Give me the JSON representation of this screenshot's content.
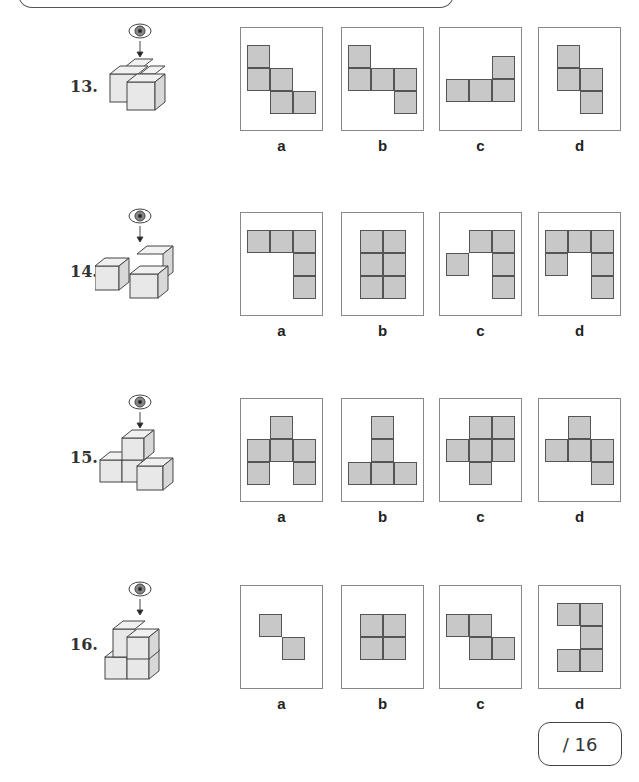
{
  "questions": [
    {
      "number": "13.",
      "view": "top-view-eye",
      "options": [
        {
          "label": "a",
          "cells": [
            [
              0,
              0
            ],
            [
              0,
              1
            ],
            [
              1,
              1
            ],
            [
              1,
              2
            ],
            [
              2,
              2
            ]
          ]
        },
        {
          "label": "b",
          "cells": [
            [
              0,
              0
            ],
            [
              0,
              1
            ],
            [
              1,
              1
            ],
            [
              2,
              1
            ],
            [
              2,
              2
            ]
          ]
        },
        {
          "label": "c",
          "cells": [
            [
              2,
              0
            ],
            [
              0,
              1
            ],
            [
              1,
              1
            ],
            [
              2,
              1
            ]
          ]
        },
        {
          "label": "d",
          "cells": [
            [
              0,
              0
            ],
            [
              0,
              1
            ],
            [
              1,
              1
            ],
            [
              1,
              2
            ]
          ]
        }
      ]
    },
    {
      "number": "14.",
      "view": "top-view-eye",
      "options": [
        {
          "label": "a",
          "cells": [
            [
              0,
              0
            ],
            [
              1,
              0
            ],
            [
              2,
              0
            ],
            [
              2,
              1
            ],
            [
              2,
              2
            ]
          ]
        },
        {
          "label": "b",
          "cells": [
            [
              0,
              0
            ],
            [
              1,
              0
            ],
            [
              0,
              1
            ],
            [
              1,
              1
            ],
            [
              0,
              2
            ],
            [
              1,
              2
            ]
          ]
        },
        {
          "label": "c",
          "cells": [
            [
              1,
              0
            ],
            [
              2,
              0
            ],
            [
              0,
              1
            ],
            [
              2,
              1
            ],
            [
              2,
              2
            ]
          ]
        },
        {
          "label": "d",
          "cells": [
            [
              0,
              0
            ],
            [
              1,
              0
            ],
            [
              2,
              0
            ],
            [
              0,
              1
            ],
            [
              2,
              1
            ],
            [
              2,
              2
            ]
          ]
        }
      ]
    },
    {
      "number": "15.",
      "view": "top-view-eye",
      "options": [
        {
          "label": "a",
          "cells": [
            [
              1,
              0
            ],
            [
              0,
              1
            ],
            [
              1,
              1
            ],
            [
              2,
              1
            ],
            [
              0,
              2
            ],
            [
              2,
              2
            ]
          ]
        },
        {
          "label": "b",
          "cells": [
            [
              1,
              0
            ],
            [
              1,
              1
            ],
            [
              0,
              2
            ],
            [
              1,
              2
            ],
            [
              2,
              2
            ]
          ]
        },
        {
          "label": "c",
          "cells": [
            [
              1,
              0
            ],
            [
              2,
              0
            ],
            [
              0,
              1
            ],
            [
              1,
              1
            ],
            [
              2,
              1
            ],
            [
              1,
              2
            ]
          ]
        },
        {
          "label": "d",
          "cells": [
            [
              1,
              0
            ],
            [
              0,
              1
            ],
            [
              1,
              1
            ],
            [
              2,
              1
            ],
            [
              2,
              2
            ]
          ]
        }
      ]
    },
    {
      "number": "16.",
      "view": "top-view-eye",
      "options": [
        {
          "label": "a",
          "cells": [
            [
              0,
              0
            ],
            [
              1,
              1
            ]
          ]
        },
        {
          "label": "b",
          "cells": [
            [
              0,
              0
            ],
            [
              1,
              0
            ],
            [
              0,
              1
            ],
            [
              1,
              1
            ]
          ]
        },
        {
          "label": "c",
          "cells": [
            [
              0,
              0
            ],
            [
              1,
              0
            ],
            [
              1,
              1
            ],
            [
              2,
              1
            ]
          ]
        },
        {
          "label": "d",
          "cells": [
            [
              0,
              0
            ],
            [
              1,
              0
            ],
            [
              1,
              1
            ],
            [
              0,
              2
            ],
            [
              1,
              2
            ]
          ]
        }
      ]
    }
  ],
  "score": {
    "label": "/ 16"
  }
}
